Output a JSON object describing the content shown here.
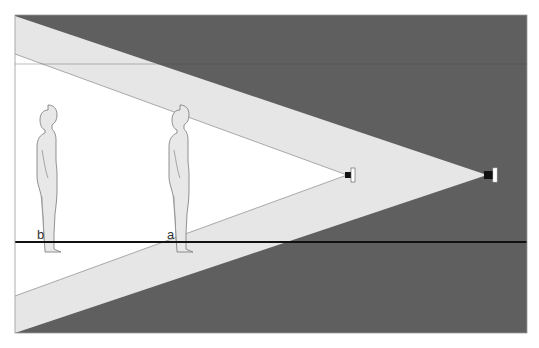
{
  "diagram": {
    "title": "",
    "labels": {
      "a": "a",
      "b": "b"
    },
    "colors": {
      "background": "#ffffff",
      "far_beam_shadow": "#5f5f5f",
      "near_beam_fill": "#e6e6e6",
      "lit_area": "#ffffff",
      "floor_line": "#111111",
      "figure_fill": "#e8e8e8",
      "figure_stroke": "#777777",
      "frame_stroke": "#999999"
    },
    "frame": {
      "x": 15,
      "y": 15,
      "width": 512,
      "height": 318
    },
    "floor_y": 242,
    "projectors": [
      {
        "id": "a",
        "position": "near",
        "x": 347,
        "y": 175
      },
      {
        "id": "b",
        "position": "far",
        "x": 487,
        "y": 175
      }
    ],
    "figures": [
      {
        "id": "b",
        "label": "b",
        "x": 48,
        "floor_y": 242
      },
      {
        "id": "a",
        "label": "a",
        "x": 180,
        "floor_y": 242
      }
    ]
  }
}
